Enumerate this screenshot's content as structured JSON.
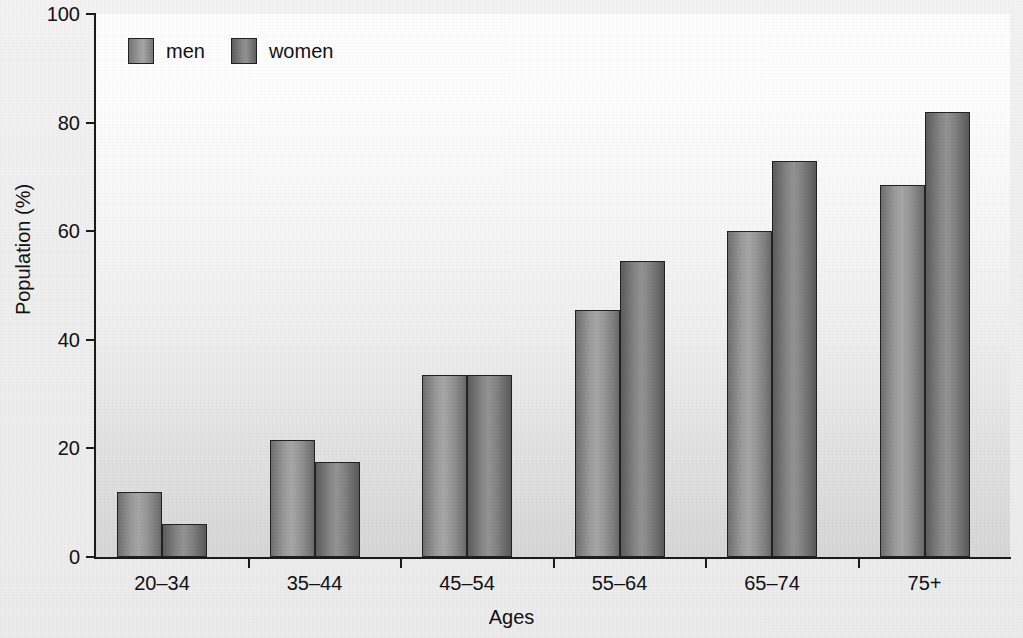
{
  "chart_data": {
    "type": "bar",
    "title": "",
    "subtitle": "",
    "xlabel": "Ages",
    "ylabel": "Population (%)",
    "categories": [
      "20–34",
      "35–44",
      "45–54",
      "55–64",
      "65–74",
      "75+"
    ],
    "series": [
      {
        "name": "men",
        "values": [
          12,
          21.5,
          33.5,
          45.5,
          60,
          68.5
        ],
        "color": "#9a9a9a"
      },
      {
        "name": "women",
        "values": [
          6,
          17.5,
          33.5,
          54.5,
          73,
          82
        ],
        "color": "#7d7d7d"
      }
    ],
    "ylim": [
      0,
      100
    ],
    "y_ticks": [
      0,
      20,
      40,
      60,
      80,
      100
    ],
    "y_tick_labels": [
      "0",
      "20",
      "40",
      "60",
      "80",
      "100"
    ],
    "grid": false,
    "legend_position": "top-left",
    "legend_entries": [
      "men",
      "women"
    ],
    "annotations": []
  },
  "axes": {
    "y_title": "Population (%)",
    "x_title": "Ages"
  },
  "legend": {
    "men_label": "men",
    "women_label": "women"
  }
}
